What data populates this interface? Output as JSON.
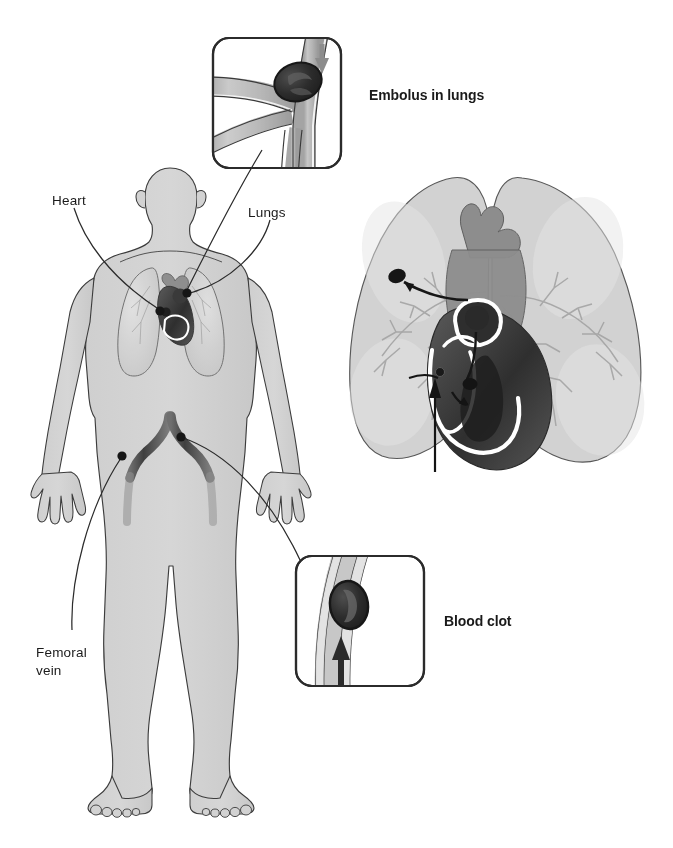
{
  "figure": {
    "background_color": "#ffffff",
    "ink_color": "#1a1a1a"
  },
  "palette": {
    "body_fill": "#d2d2d2",
    "body_outline": "#3c3c3c",
    "lung_fill": "#cfcfcf",
    "lung_fill_light": "#dcdcdc",
    "lung_outline": "#4a4a4a",
    "vessel_dark": "#4a4a4a",
    "vessel_mid": "#6e6e6e",
    "vessel_light": "#b8b8b8",
    "heart_mid": "#8a8a8a",
    "heart_dark": "#3a3a3a",
    "clot_dark": "#2b2b2b",
    "clot_inner": "#5a5a5a",
    "arrow_gray": "#8c8c8c",
    "leader_line": "#2b2b2b",
    "inset_border": "#2b2b2b",
    "white": "#ffffff"
  },
  "labels": {
    "heart": "Heart",
    "lungs": "Lungs",
    "femoral_vein_line1": "Femoral",
    "femoral_vein_line2": "vein",
    "embolus_in_lungs": "Embolus in lungs",
    "blood_clot": "Blood clot"
  },
  "insets": [
    {
      "id": "embolus-inset",
      "caption": "Embolus in lungs",
      "depicts": "branching pulmonary artery with dark embolus lodged at a vessel bifurcation",
      "arrow_direction": "down",
      "x": 213,
      "y": 38,
      "width": 128,
      "height": 130
    },
    {
      "id": "clot-inset",
      "caption": "Blood clot",
      "depicts": "cross-section of a vein with a dark blood clot and upward blood-flow arrow",
      "arrow_direction": "up",
      "x": 296,
      "y": 556,
      "width": 128,
      "height": 130
    }
  ],
  "anatomy_callouts": [
    {
      "id": "heart",
      "label": "Heart",
      "label_x": 55,
      "label_y": 196,
      "dot_x": 160,
      "dot_y": 312
    },
    {
      "id": "lungs",
      "label": "Lungs",
      "label_x": 250,
      "label_y": 208,
      "dot_x": 186,
      "dot_y": 294
    },
    {
      "id": "femoral-vein",
      "label": "Femoral vein",
      "label_x": 38,
      "label_y": 648,
      "dot_x": 123,
      "dot_y": 455
    }
  ],
  "body_figure": {
    "view": "anterior full-body silhouette",
    "features": [
      "head",
      "ears",
      "neck",
      "shoulders",
      "arms",
      "hands",
      "torso",
      "legs",
      "feet"
    ],
    "internal_organs": [
      "lungs",
      "heart",
      "inferior vena cava",
      "iliac veins",
      "femoral veins"
    ]
  },
  "detail_illustration": {
    "id": "heart-lungs-detail",
    "depicts": "cutaway of heart between both lungs with clot path arrows from vena cava through right heart into pulmonary artery",
    "clot_markers": 3,
    "flow_arrows": 3
  },
  "credit": {
    "text": ""
  }
}
